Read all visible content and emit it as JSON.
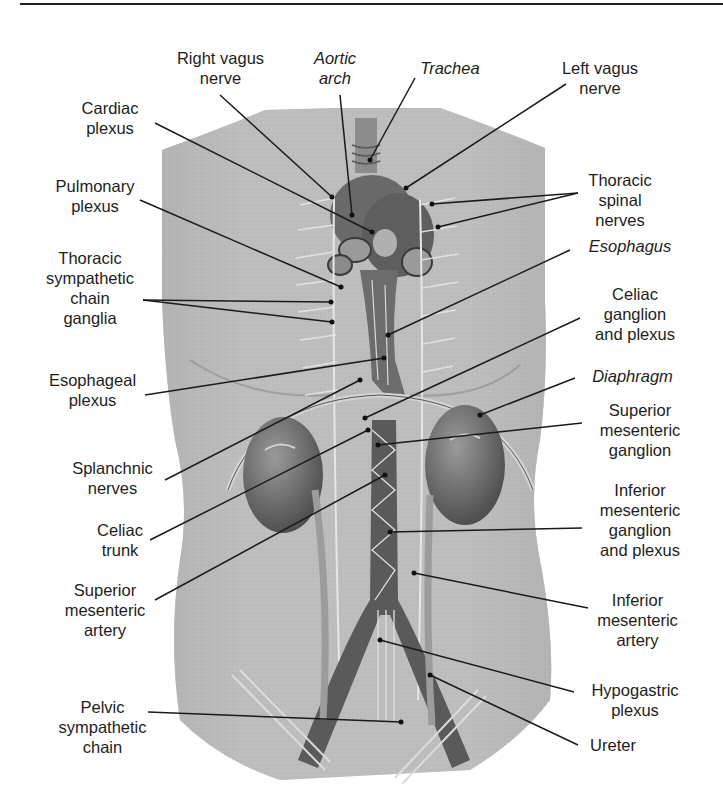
{
  "figure": {
    "colors": {
      "background": "#ffffff",
      "skin": "#bdbdbd",
      "skin_dark": "#9a9a9a",
      "organ": "#6f6f6f",
      "line": "#1a1a1a",
      "text": "#1d1d1d"
    }
  },
  "labels": {
    "right_vagus_nerve": "Right vagus\nnerve",
    "aortic_arch": "Aortic\narch",
    "trachea": "Trachea",
    "left_vagus_nerve": "Left vagus\nnerve",
    "cardiac_plexus": "Cardiac\nplexus",
    "thoracic_spinal_nerves": "Thoracic\nspinal\nnerves",
    "pulmonary_plexus": "Pulmonary\nplexus",
    "esophagus": "Esophagus",
    "thoracic_sympathetic_chain_ganglia": "Thoracic\nsympathetic\nchain\nganglia",
    "celiac_ganglion_and_plexus": "Celiac\nganglion\nand plexus",
    "esophageal_plexus": "Esophageal\nplexus",
    "diaphragm": "Diaphragm",
    "superior_mesenteric_ganglion": "Superior\nmesenteric\nganglion",
    "splanchnic_nerves": "Splanchnic\nnerves",
    "inferior_mesenteric_ganglion_and_plexus": "Inferior\nmesenteric\nganglion\nand plexus",
    "celiac_trunk": "Celiac\ntrunk",
    "superior_mesenteric_artery": "Superior\nmesenteric\nartery",
    "inferior_mesenteric_artery": "Inferior\nmesenteric\nartery",
    "hypogastric_plexus": "Hypogastric\nplexus",
    "pelvic_sympathetic_chain": "Pelvic\nsympathetic\nchain",
    "ureter": "Ureter"
  }
}
